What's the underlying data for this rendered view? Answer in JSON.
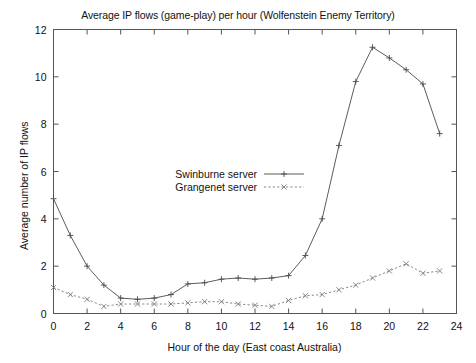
{
  "chart_data": {
    "type": "line",
    "title": "Average IP flows (game-play) per hour (Wolfenstein Enemy Territory)",
    "xlabel": "Hour of the day (East coast Australia)",
    "ylabel": "Average number of IP flows",
    "xlim": [
      0,
      24
    ],
    "ylim": [
      0,
      12
    ],
    "xticks": [
      0,
      2,
      4,
      6,
      8,
      10,
      12,
      14,
      16,
      18,
      20,
      22,
      24
    ],
    "yticks": [
      0,
      2,
      4,
      6,
      8,
      10,
      12
    ],
    "xtick_labels": [
      "0",
      "2",
      "4",
      "6",
      "8",
      "10",
      "12",
      "14",
      "16",
      "18",
      "20",
      "22",
      "24"
    ],
    "ytick_labels": [
      "0",
      "2",
      "4",
      "6",
      "8",
      "10",
      "12"
    ],
    "grid": false,
    "legend_position": "center-left",
    "x": [
      0,
      1,
      2,
      3,
      4,
      5,
      6,
      7,
      8,
      9,
      10,
      11,
      12,
      13,
      14,
      15,
      16,
      17,
      18,
      19,
      20,
      21,
      22,
      23
    ],
    "series": [
      {
        "name": "Swinburne server",
        "marker": "plus",
        "linestyle": "solid",
        "color": "#4a4a4a",
        "values": [
          4.85,
          3.3,
          2.0,
          1.2,
          0.65,
          0.6,
          0.65,
          0.8,
          1.25,
          1.3,
          1.45,
          1.5,
          1.45,
          1.5,
          1.6,
          2.45,
          4.0,
          7.1,
          9.8,
          11.25,
          10.8,
          10.3,
          9.7,
          7.6
        ]
      },
      {
        "name": "Grangenet server",
        "marker": "cross",
        "linestyle": "dashed",
        "color": "#7a7a7a",
        "values": [
          1.1,
          0.8,
          0.6,
          0.3,
          0.4,
          0.4,
          0.4,
          0.4,
          0.45,
          0.5,
          0.5,
          0.4,
          0.35,
          0.3,
          0.55,
          0.75,
          0.8,
          1.0,
          1.2,
          1.5,
          1.8,
          2.1,
          1.7,
          1.8
        ]
      }
    ]
  },
  "legend": {
    "entries": [
      {
        "label": "Swinburne server"
      },
      {
        "label": "Grangenet server"
      }
    ]
  }
}
